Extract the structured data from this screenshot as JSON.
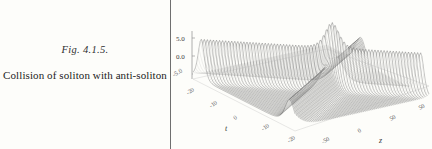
{
  "figure": {
    "number_label": "Fig. 4.1.5.",
    "caption": "Collision of  soliton with anti-soliton"
  },
  "divider": {
    "name": "vertical-rule",
    "color": "#6f6f6f"
  },
  "colors": {
    "page_background": "#fdfdfa",
    "ink": "#232323",
    "mesh_line": "#555555",
    "axis_line": "#8a8a8a"
  },
  "chart_data": {
    "type": "line",
    "render": "3d-wireframe-surface",
    "title": "",
    "subtitle": "",
    "xlabel": "t",
    "ylabel": "z",
    "zlabel": "",
    "grid": false,
    "legend": null,
    "axes": {
      "z": {
        "ticks": [
          "5.0",
          "0.0",
          "-5.0"
        ],
        "values": [
          5.0,
          0.0,
          -5.0
        ],
        "range": [
          -5.0,
          5.0
        ]
      },
      "t": {
        "ticks": [
          "-20",
          "-10",
          "0",
          "-10",
          "-20"
        ],
        "values": [
          -20,
          -10,
          0,
          -10,
          -20
        ],
        "range": [
          -20,
          -20
        ],
        "axis_title": "t"
      },
      "z_horizontal": {
        "ticks": [
          "-50",
          "0",
          "50",
          "50"
        ],
        "values": [
          -50,
          0,
          50,
          50
        ],
        "axis_title": "z"
      }
    },
    "peaks": [
      {
        "name": "soliton",
        "t": 0,
        "z": 0,
        "height": 5.0
      },
      {
        "name": "anti-soliton",
        "t": 5,
        "z": 18,
        "height": 2.2
      }
    ],
    "surface_points": {
      "t_min": -20,
      "t_max": 20,
      "z_min": -50,
      "z_max": 50,
      "amp_min": 0,
      "amp_max": 5.0
    }
  }
}
